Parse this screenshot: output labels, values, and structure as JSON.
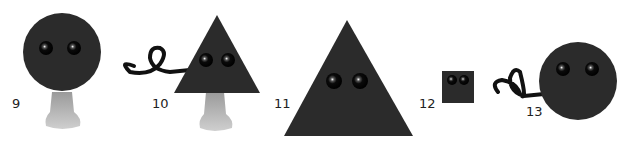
{
  "figures": [
    {
      "id": 9,
      "label": "9",
      "shape": "circle",
      "size": "large",
      "has_tail": false,
      "has_foot": true
    },
    {
      "id": 10,
      "label": "10",
      "shape": "triangle",
      "size": "medium",
      "has_tail": true,
      "has_foot": true
    },
    {
      "id": 11,
      "label": "11",
      "shape": "triangle",
      "size": "large",
      "has_tail": false,
      "has_foot": false
    },
    {
      "id": 12,
      "label": "12",
      "shape": "square",
      "size": "small",
      "has_tail": false,
      "has_foot": false
    },
    {
      "id": 13,
      "label": "13",
      "shape": "circle",
      "size": "large",
      "has_tail": true,
      "has_foot": false
    }
  ],
  "colors": {
    "body": "#2b2b2b",
    "foot": "#b8b8b8",
    "tail": "#111111",
    "label": "#222222"
  }
}
